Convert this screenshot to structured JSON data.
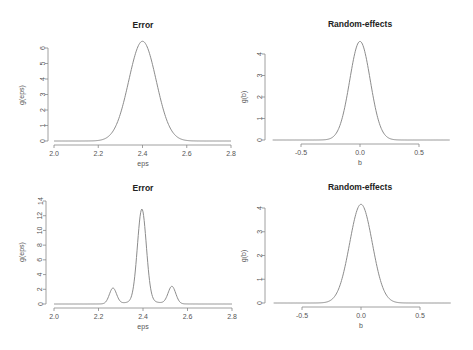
{
  "chart_data": [
    {
      "type": "line",
      "title": "Error",
      "xlabel": "eps",
      "ylabel": "g(eps)",
      "xlim": [
        2.0,
        2.8
      ],
      "ylim": [
        0,
        6
      ],
      "xticks": [
        2.0,
        2.2,
        2.4,
        2.6,
        2.8
      ],
      "xtick_labels": [
        "2.0",
        "2.2",
        "2.4",
        "2.6",
        "2.8"
      ],
      "yticks": [
        0,
        1,
        2,
        3,
        4,
        5,
        6
      ],
      "ytick_labels": [
        "0",
        "1",
        "2",
        "3",
        "4",
        "5",
        "6"
      ],
      "grid": false,
      "series": [
        {
          "name": "density",
          "shape": "unimodal",
          "peak_x": 2.4,
          "peak_y": 6.4,
          "components": [
            {
              "mean": 2.4,
              "sd": 0.062,
              "weight": 1.0
            }
          ]
        }
      ],
      "key_points": {
        "x": [
          2.0,
          2.2,
          2.3,
          2.35,
          2.4,
          2.45,
          2.5,
          2.6,
          2.8
        ],
        "y": [
          0,
          0.04,
          1.7,
          4.6,
          6.4,
          4.6,
          1.7,
          0.04,
          0
        ]
      }
    },
    {
      "type": "line",
      "title": "Random-effects",
      "xlabel": "b",
      "ylabel": "g(b)",
      "xlim": [
        -0.75,
        0.76
      ],
      "ylim": [
        0,
        4
      ],
      "xticks": [
        -0.5,
        0.0,
        0.5
      ],
      "xtick_labels": [
        "-0.5",
        "0.0",
        "0.5"
      ],
      "yticks": [
        0,
        1,
        2,
        3,
        4
      ],
      "ytick_labels": [
        "0",
        "1",
        "2",
        "3",
        "4"
      ],
      "grid": false,
      "series": [
        {
          "name": "density",
          "shape": "unimodal",
          "peak_x": 0.0,
          "peak_y": 4.6,
          "components": [
            {
              "mean": 0.0,
              "sd": 0.087,
              "weight": 1.0
            }
          ]
        }
      ],
      "key_points": {
        "x": [
          -0.75,
          -0.3,
          -0.15,
          -0.1,
          0.0,
          0.1,
          0.15,
          0.3,
          0.76
        ],
        "y": [
          0,
          0.01,
          1.05,
          2.3,
          4.6,
          2.3,
          1.05,
          0.01,
          0
        ]
      }
    },
    {
      "type": "line",
      "title": "Error",
      "xlabel": "eps",
      "ylabel": "g(eps)",
      "xlim": [
        2.0,
        2.8
      ],
      "ylim": [
        0,
        14
      ],
      "xticks": [
        2.0,
        2.2,
        2.4,
        2.6,
        2.8
      ],
      "xtick_labels": [
        "2.0",
        "2.2",
        "2.4",
        "2.6",
        "2.8"
      ],
      "yticks": [
        0,
        2,
        4,
        6,
        8,
        10,
        12,
        14
      ],
      "ytick_labels": [
        "0",
        "2",
        "4",
        "6",
        "8",
        "10",
        "12",
        "14"
      ],
      "grid": false,
      "series": [
        {
          "name": "density",
          "shape": "trimodal",
          "peaks": [
            {
              "x": 2.265,
              "y": 2.4
            },
            {
              "x": 2.395,
              "y": 13.5
            },
            {
              "x": 2.53,
              "y": 2.7
            }
          ],
          "components": [
            {
              "mean": 2.395,
              "sd": 0.02,
              "weight": 0.63
            },
            {
              "mean": 2.265,
              "sd": 0.016,
              "weight": 0.085
            },
            {
              "mean": 2.53,
              "sd": 0.017,
              "weight": 0.1
            },
            {
              "mean": 2.4,
              "sd": 0.07,
              "weight": 0.06
            }
          ]
        }
      ],
      "key_points": {
        "x": [
          2.0,
          2.22,
          2.265,
          2.3,
          2.395,
          2.49,
          2.53,
          2.6,
          2.8
        ],
        "y": [
          0,
          0.1,
          2.4,
          0.4,
          13.5,
          0.4,
          2.7,
          0.05,
          0
        ]
      }
    },
    {
      "type": "line",
      "title": "Random-effects",
      "xlabel": "b",
      "ylabel": "g(b)",
      "xlim": [
        -0.75,
        0.76
      ],
      "ylim": [
        0,
        4
      ],
      "xticks": [
        -0.5,
        0.0,
        0.5
      ],
      "xtick_labels": [
        "-0.5",
        "0.0",
        "0.5"
      ],
      "yticks": [
        0,
        1,
        2,
        3,
        4
      ],
      "ytick_labels": [
        "0",
        "1",
        "2",
        "3",
        "4"
      ],
      "grid": false,
      "series": [
        {
          "name": "density",
          "shape": "unimodal",
          "peak_x": 0.0,
          "peak_y": 4.15,
          "components": [
            {
              "mean": 0.0,
              "sd": 0.096,
              "weight": 1.0
            }
          ]
        }
      ],
      "key_points": {
        "x": [
          -0.75,
          -0.3,
          -0.15,
          -0.1,
          0.0,
          0.1,
          0.15,
          0.3,
          0.76
        ],
        "y": [
          0,
          0.03,
          1.22,
          2.4,
          4.15,
          2.4,
          1.22,
          0.03,
          0
        ]
      }
    }
  ],
  "panels": [
    {
      "title": "Error",
      "xlabel": "eps",
      "ylabel": "g(eps)"
    },
    {
      "title": "Random-effects",
      "xlabel": "b",
      "ylabel": "g(b)"
    },
    {
      "title": "Error",
      "xlabel": "eps",
      "ylabel": "g(eps)"
    },
    {
      "title": "Random-effects",
      "xlabel": "b",
      "ylabel": "g(b)"
    }
  ],
  "layout": [
    {
      "plot": {
        "x0": 54,
        "x1": 231,
        "yTop": 48,
        "yBase": 141
      },
      "xaxisY": 145,
      "yaxisX": 48,
      "titleY": 28,
      "xlabelY": 166,
      "ylabelX": 21,
      "xPad": [
        2.0,
        2.8
      ]
    },
    {
      "plot": {
        "x0": 301,
        "x1": 419,
        "yTop": 54,
        "yBase": 140
      },
      "xaxisY": 144,
      "yaxisX": 265,
      "titleY": 27,
      "xlabelY": 165,
      "ylabelX": 243,
      "xPad": [
        -0.74,
        0.76
      ]
    },
    {
      "plot": {
        "x0": 54,
        "x1": 232,
        "yTop": 201,
        "yBase": 304
      },
      "xaxisY": 308,
      "yaxisX": 46,
      "titleY": 191,
      "xlabelY": 329,
      "ylabelX": 21,
      "xPad": [
        2.0,
        2.8
      ]
    },
    {
      "plot": {
        "x0": 302,
        "x1": 420,
        "yTop": 208,
        "yBase": 303
      },
      "xaxisY": 307,
      "yaxisX": 265,
      "titleY": 190,
      "xlabelY": 328,
      "ylabelX": 243,
      "xPad": [
        -0.74,
        0.76
      ]
    }
  ],
  "colors": {
    "curve": "#8c8c8c",
    "axis": "#888888",
    "text": "#555555",
    "title": "#222222"
  }
}
